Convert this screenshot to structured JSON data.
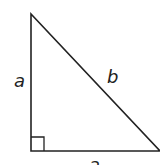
{
  "diagram": {
    "labels": {
      "left_leg": "a",
      "hypotenuse": "b",
      "bottom_leg": "a"
    },
    "stroke_color": "#222222",
    "background": "#ffffff"
  }
}
